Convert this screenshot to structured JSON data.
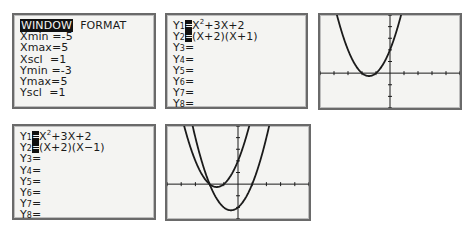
{
  "window_screen": {
    "tabs": [
      {
        "label": "WINDOW",
        "selected": true
      },
      {
        "label": "FORMAT",
        "selected": false
      }
    ],
    "settings": [
      {
        "name": "Xmin",
        "sep": " =",
        "value": "-5"
      },
      {
        "name": "Xmax",
        "sep": "=",
        "value": "5"
      },
      {
        "name": "Xscl",
        "sep": "  =",
        "value": "1"
      },
      {
        "name": "Ymin",
        "sep": " =",
        "value": "-3"
      },
      {
        "name": "Ymax",
        "sep": "=",
        "value": "5"
      },
      {
        "name": "Yscl",
        "sep": "  =",
        "value": "1"
      }
    ]
  },
  "y_editor_1": {
    "entries": [
      {
        "label": "Y",
        "index": "1",
        "selected": true,
        "expr_pre": "X",
        "sup": "2",
        "expr_post": "+3X+2"
      },
      {
        "label": "Y",
        "index": "2",
        "selected": true,
        "expr_pre": "(X+2)(X+1)",
        "sup": "",
        "expr_post": ""
      },
      {
        "label": "Y",
        "index": "3",
        "selected": false,
        "expr_pre": "",
        "sup": "",
        "expr_post": ""
      },
      {
        "label": "Y",
        "index": "4",
        "selected": false,
        "expr_pre": "",
        "sup": "",
        "expr_post": ""
      },
      {
        "label": "Y",
        "index": "5",
        "selected": false,
        "expr_pre": "",
        "sup": "",
        "expr_post": ""
      },
      {
        "label": "Y",
        "index": "6",
        "selected": false,
        "expr_pre": "",
        "sup": "",
        "expr_post": ""
      },
      {
        "label": "Y",
        "index": "7",
        "selected": false,
        "expr_pre": "",
        "sup": "",
        "expr_post": ""
      },
      {
        "label": "Y",
        "index": "8",
        "selected": false,
        "expr_pre": "",
        "sup": "",
        "expr_post": ""
      }
    ]
  },
  "y_editor_2": {
    "entries": [
      {
        "label": "Y",
        "index": "1",
        "selected": true,
        "expr_pre": "X",
        "sup": "2",
        "expr_post": "+3X+2"
      },
      {
        "label": "Y",
        "index": "2",
        "selected": true,
        "expr_pre": "(X+2)(X−1)",
        "sup": "",
        "expr_post": ""
      },
      {
        "label": "Y",
        "index": "3",
        "selected": false,
        "expr_pre": "",
        "sup": "",
        "expr_post": ""
      },
      {
        "label": "Y",
        "index": "4",
        "selected": false,
        "expr_pre": "",
        "sup": "",
        "expr_post": ""
      },
      {
        "label": "Y",
        "index": "5",
        "selected": false,
        "expr_pre": "",
        "sup": "",
        "expr_post": ""
      },
      {
        "label": "Y",
        "index": "6",
        "selected": false,
        "expr_pre": "",
        "sup": "",
        "expr_post": ""
      },
      {
        "label": "Y",
        "index": "7",
        "selected": false,
        "expr_pre": "",
        "sup": "",
        "expr_post": ""
      },
      {
        "label": "Y",
        "index": "8",
        "selected": false,
        "expr_pre": "",
        "sup": "",
        "expr_post": ""
      }
    ]
  },
  "graph_1": {
    "window": {
      "xmin": -5,
      "xmax": 5,
      "ymin": -3,
      "ymax": 5
    },
    "curves": [
      "x^2+3x+2"
    ]
  },
  "graph_2": {
    "window": {
      "xmin": -5,
      "xmax": 5,
      "ymin": -3,
      "ymax": 5
    },
    "curves": [
      "x^2+3x+2",
      "(x+2)(x-1)"
    ]
  },
  "colors": {
    "screen_bg": "#f4f4f2",
    "border": "#6a6a6a",
    "ink": "#1b1b1b"
  }
}
